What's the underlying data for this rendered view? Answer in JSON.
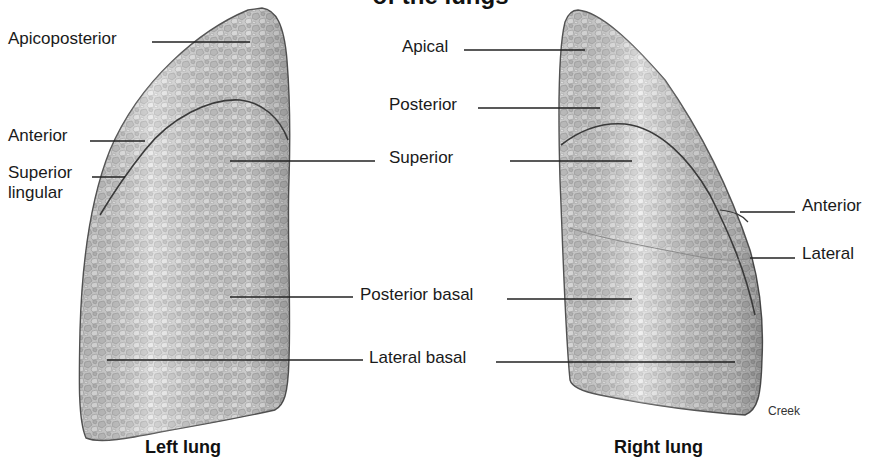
{
  "title": "of the lungs",
  "left_lung": {
    "caption": "Left lung",
    "labels": {
      "apicoposterior": "Apicoposterior",
      "anterior": "Anterior",
      "superior_lingular_1": "Superior",
      "superior_lingular_2": "lingular"
    }
  },
  "shared_labels": {
    "superior": "Superior",
    "posterior_basal": "Posterior basal",
    "lateral_basal": "Lateral basal"
  },
  "right_lung": {
    "caption": "Right lung",
    "labels": {
      "apical": "Apical",
      "posterior": "Posterior",
      "anterior": "Anterior",
      "lateral": "Lateral"
    }
  },
  "credit": "Creek",
  "colors": {
    "lung_fill": "#d9d9d9",
    "lung_outline": "#555555",
    "fissure": "#3a3a3a",
    "leader_line": "#222222"
  }
}
